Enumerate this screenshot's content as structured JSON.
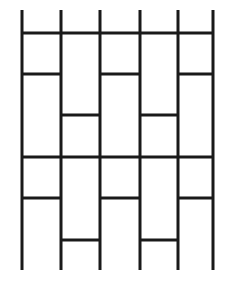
{
  "figure": {
    "type": "line-drawing",
    "width": 234,
    "height": 289,
    "background_color": "#ffffff",
    "line_color": "#1a1a1a",
    "line_width": 3
  },
  "chart_data": {
    "type": "line",
    "xlabel": "",
    "ylabel": "",
    "grid": false,
    "legend": null,
    "xlim": [
      0,
      234
    ],
    "ylim": [
      0,
      289
    ],
    "vertical_line_x": [
      22,
      61,
      100,
      140,
      178,
      213
    ],
    "vertical_line_extent": [
      10,
      270
    ],
    "horizontal_rail_y": [
      33,
      157
    ],
    "horizontal_rail_extent": [
      22,
      213
    ],
    "rung_rows": [
      {
        "y": 74,
        "bays": "odd",
        "segments": [
          [
            22,
            61
          ],
          [
            100,
            140
          ],
          [
            178,
            213
          ]
        ]
      },
      {
        "y": 115,
        "bays": "even",
        "segments": [
          [
            61,
            100
          ],
          [
            140,
            178
          ]
        ]
      },
      {
        "y": 198,
        "bays": "odd",
        "segments": [
          [
            22,
            61
          ],
          [
            100,
            140
          ],
          [
            178,
            213
          ]
        ]
      },
      {
        "y": 240,
        "bays": "even",
        "segments": [
          [
            61,
            100
          ],
          [
            140,
            178
          ]
        ]
      }
    ],
    "segments": [
      {
        "name": "vertical-1",
        "x1": 22,
        "y1": 10,
        "x2": 22,
        "y2": 270
      },
      {
        "name": "vertical-2",
        "x1": 61,
        "y1": 10,
        "x2": 61,
        "y2": 270
      },
      {
        "name": "vertical-3",
        "x1": 100,
        "y1": 10,
        "x2": 100,
        "y2": 270
      },
      {
        "name": "vertical-4",
        "x1": 140,
        "y1": 10,
        "x2": 140,
        "y2": 270
      },
      {
        "name": "vertical-5",
        "x1": 178,
        "y1": 10,
        "x2": 178,
        "y2": 270
      },
      {
        "name": "vertical-6",
        "x1": 213,
        "y1": 10,
        "x2": 213,
        "y2": 270
      },
      {
        "name": "rail-top",
        "x1": 22,
        "y1": 33,
        "x2": 213,
        "y2": 33
      },
      {
        "name": "rail-middle",
        "x1": 22,
        "y1": 157,
        "x2": 213,
        "y2": 157
      },
      {
        "name": "rung-r1-a",
        "x1": 22,
        "y1": 74,
        "x2": 61,
        "y2": 74
      },
      {
        "name": "rung-r1-b",
        "x1": 100,
        "y1": 74,
        "x2": 140,
        "y2": 74
      },
      {
        "name": "rung-r1-c",
        "x1": 178,
        "y1": 74,
        "x2": 213,
        "y2": 74
      },
      {
        "name": "rung-r2-a",
        "x1": 61,
        "y1": 115,
        "x2": 100,
        "y2": 115
      },
      {
        "name": "rung-r2-b",
        "x1": 140,
        "y1": 115,
        "x2": 178,
        "y2": 115
      },
      {
        "name": "rung-r3-a",
        "x1": 22,
        "y1": 198,
        "x2": 61,
        "y2": 198
      },
      {
        "name": "rung-r3-b",
        "x1": 100,
        "y1": 198,
        "x2": 140,
        "y2": 198
      },
      {
        "name": "rung-r3-c",
        "x1": 178,
        "y1": 198,
        "x2": 213,
        "y2": 198
      },
      {
        "name": "rung-r4-a",
        "x1": 61,
        "y1": 240,
        "x2": 100,
        "y2": 240
      },
      {
        "name": "rung-r4-b",
        "x1": 140,
        "y1": 240,
        "x2": 178,
        "y2": 240
      }
    ]
  }
}
